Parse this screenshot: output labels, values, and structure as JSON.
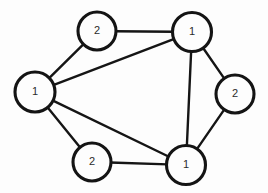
{
  "diagram": {
    "type": "node-link-graph",
    "background_color": "#fdfdfd",
    "node_stroke_color": "#141414",
    "node_fill_color": "#fdfdfd",
    "edge_color": "#151515",
    "label_color": "#2b2b2b",
    "nodes": [
      {
        "id": "top-left",
        "label": "2",
        "cx": 97,
        "cy": 31,
        "r": 19
      },
      {
        "id": "top-right",
        "label": "1",
        "cx": 192,
        "cy": 32,
        "r": 19.5
      },
      {
        "id": "left",
        "label": "1",
        "cx": 35,
        "cy": 92,
        "r": 20
      },
      {
        "id": "right",
        "label": "2",
        "cx": 235,
        "cy": 94,
        "r": 19
      },
      {
        "id": "bottom-left",
        "label": "2",
        "cx": 92,
        "cy": 162,
        "r": 19
      },
      {
        "id": "bottom-right",
        "label": "1",
        "cx": 186,
        "cy": 165,
        "r": 19.5
      }
    ],
    "edges": [
      {
        "id": "edge-top-left--top-right",
        "from": "top-left",
        "to": "top-right"
      },
      {
        "id": "edge-left--top-left",
        "from": "left",
        "to": "top-left"
      },
      {
        "id": "edge-left--top-right",
        "from": "left",
        "to": "top-right"
      },
      {
        "id": "edge-left--bottom-left",
        "from": "left",
        "to": "bottom-left"
      },
      {
        "id": "edge-left--bottom-right",
        "from": "left",
        "to": "bottom-right"
      },
      {
        "id": "edge-top-right--right",
        "from": "top-right",
        "to": "right"
      },
      {
        "id": "edge-top-right--bottom-right",
        "from": "top-right",
        "to": "bottom-right"
      },
      {
        "id": "edge-right--bottom-right",
        "from": "right",
        "to": "bottom-right"
      },
      {
        "id": "edge-bottom-left--bottom-right",
        "from": "bottom-left",
        "to": "bottom-right"
      }
    ]
  }
}
